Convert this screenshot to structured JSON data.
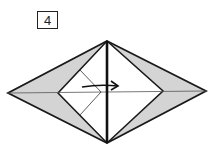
{
  "step": {
    "number": "4"
  },
  "diagram": {
    "colors": {
      "line": "#1a1a1a",
      "shade": "#d4d4d4",
      "paper": "#ffffff"
    },
    "arrow": {
      "direction": "right",
      "meaning": "fold left flap to the right"
    }
  }
}
